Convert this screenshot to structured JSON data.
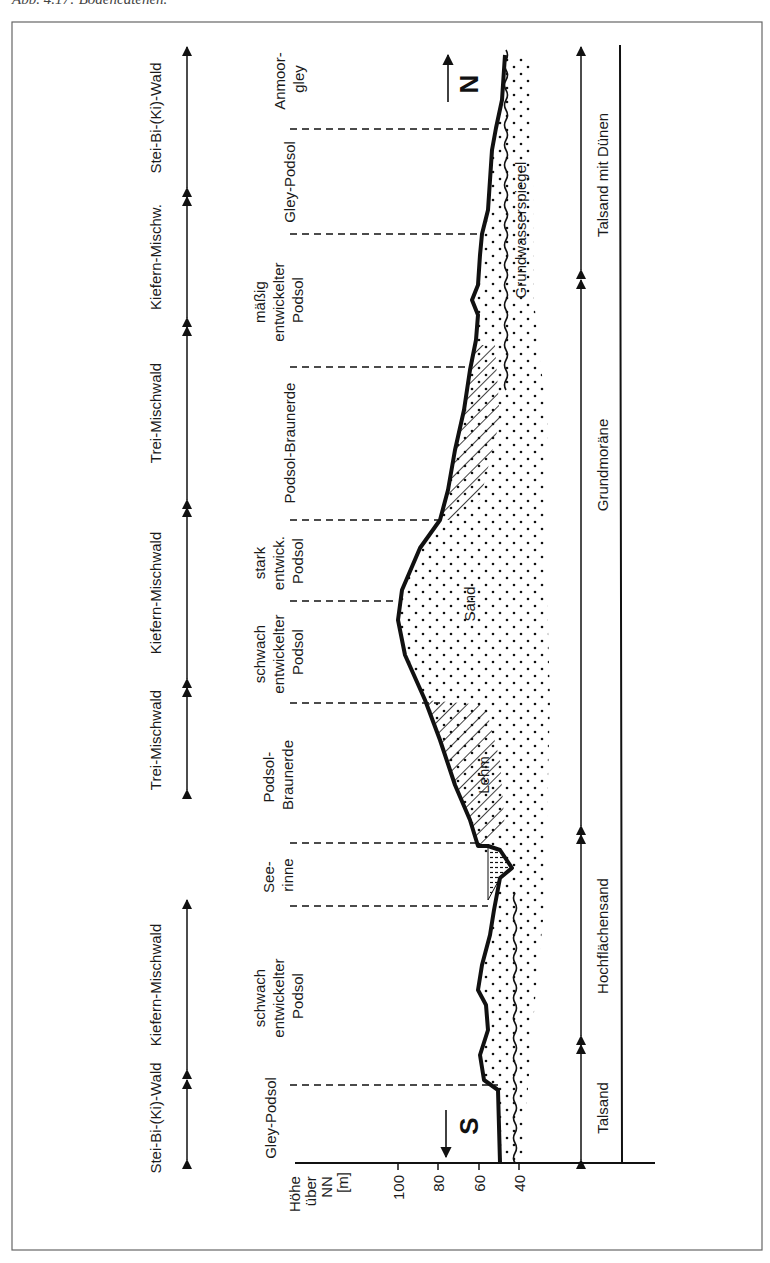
{
  "caption": "Abb. 4.17: Bodencatenen.",
  "axis": {
    "title_lines": [
      "Höhe",
      "über",
      "NN",
      "[m]"
    ],
    "ticks": [
      "100",
      "80",
      "60",
      "40"
    ]
  },
  "directions": {
    "south": "S",
    "north": "N"
  },
  "vegetation": [
    {
      "label": "Stei-Bi-(Ki)-Wald"
    },
    {
      "label": "Kiefern-Mischwald"
    },
    {
      "label": "Trei-Mischwald"
    },
    {
      "label": "Kiefern-Mischwald"
    },
    {
      "label": "Trei-Mischwald"
    },
    {
      "label": "Kiefern-Mischw."
    },
    {
      "label": "Stei-Bi-(Ki)-Wald"
    }
  ],
  "soils": [
    {
      "lines": [
        "Gley-Podsol"
      ]
    },
    {
      "lines": [
        "schwach",
        "entwickelter",
        "Podsol"
      ]
    },
    {
      "lines": [
        "See-",
        "rinne"
      ]
    },
    {
      "lines": [
        "Podsol-",
        "Braunerde"
      ]
    },
    {
      "lines": [
        "schwach",
        "entwickelter",
        "Podsol"
      ]
    },
    {
      "lines": [
        "stark",
        "entwick.",
        "Podsol"
      ]
    },
    {
      "lines": [
        "Podsol-Braunerde"
      ]
    },
    {
      "lines": [
        "mäßig",
        "entwickelter",
        "Podsol"
      ]
    },
    {
      "lines": [
        "Gley-Podsol"
      ]
    },
    {
      "lines": [
        "Anmoor-",
        "gley"
      ]
    }
  ],
  "materials": {
    "sand": "Sand",
    "lehm": "Lehm",
    "groundwater": "Grundwasserspiegel"
  },
  "geology": [
    {
      "label": "Talsand"
    },
    {
      "label": "Hochflächensand"
    },
    {
      "label": "Grundmoräne"
    },
    {
      "label": "Talsand mit Dünen"
    }
  ],
  "colors": {
    "ink": "#111111",
    "frame": "#555555",
    "background": "#ffffff"
  }
}
